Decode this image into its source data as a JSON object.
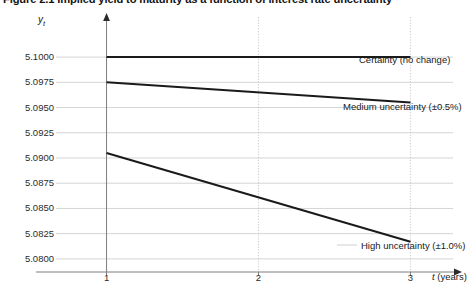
{
  "figure": {
    "title": "Figure 2.1  Implied yield to maturity as a function of interest rate uncertainty"
  },
  "axes": {
    "y_title_var": "y",
    "y_title_sub": "t",
    "x_title_var": "t",
    "x_title_unit": " (years)"
  },
  "chart_data": {
    "type": "line",
    "title": "Figure 2.1  Implied yield to maturity as a function of interest rate uncertainty",
    "xlabel": "t (years)",
    "ylabel": "y_t",
    "xlim": [
      0.72,
      3.28
    ],
    "ylim": [
      5.0787,
      5.1012
    ],
    "xticks": [
      1,
      2,
      3
    ],
    "xtick_labels": [
      "1",
      "2",
      "3"
    ],
    "yticks": [
      5.08,
      5.0825,
      5.085,
      5.0875,
      5.09,
      5.0925,
      5.095,
      5.0975,
      5.1
    ],
    "ytick_labels": [
      "5.0800",
      "5.0825",
      "5.0850",
      "5.0875",
      "5.0900",
      "5.0925",
      "5.0950",
      "5.0975",
      "5.1000"
    ],
    "grid": "horizontal-solid-light; vertical-dotted at x=2 and x=3",
    "legend": "inline annotations at right of each line",
    "x": [
      1,
      3
    ],
    "series": [
      {
        "name": "Certainty (no change)",
        "label": "Certainty (no change)",
        "values": [
          5.1,
          5.1
        ],
        "color": "#1a1a1a"
      },
      {
        "name": "Medium uncertainty (±0.5%)",
        "label": "Medium uncertainty (±0.5%)",
        "values": [
          5.0975,
          5.0955
        ],
        "color": "#1a1a1a"
      },
      {
        "name": "High uncertainty (±1.0%)",
        "label": "High uncertainty (±1.0%)",
        "values": [
          5.0905,
          5.0817
        ],
        "color": "#1a1a1a"
      }
    ]
  },
  "colors": {
    "line": "#1a1a1a",
    "gridline": "#c9c9c9",
    "vertical_gridline": "#bdbdbd",
    "axis": "#7d7d7d",
    "text": "#1a1a1a"
  }
}
